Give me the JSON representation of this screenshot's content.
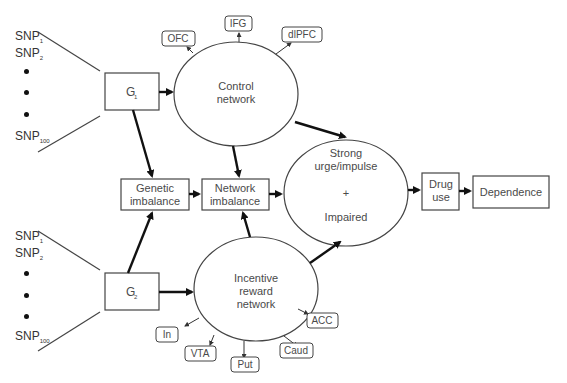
{
  "snp_groups": [
    {
      "items": [
        "SNP",
        "SNP",
        "SNP"
      ],
      "subs": [
        "1",
        "2",
        "100"
      ]
    },
    {
      "items": [
        "SNP",
        "SNP",
        "SNP"
      ],
      "subs": [
        "1",
        "2",
        "100"
      ]
    }
  ],
  "nodes": {
    "g1": {
      "label": "G",
      "sub": "1"
    },
    "g2": {
      "label": "G",
      "sub": "2"
    },
    "genetic_imbalance": {
      "line1": "Genetic",
      "line2": "imbalance"
    },
    "network_imbalance": {
      "line1": "Network",
      "line2": "imbalance"
    },
    "control_network": {
      "line1": "Control",
      "line2": "network"
    },
    "incentive_network": {
      "line1": "Incentive",
      "line2": "reward",
      "line3": "network"
    },
    "urge": {
      "line1": "Strong",
      "line2": "urge/impulse",
      "plus": "+",
      "line3": "Impaired"
    },
    "drug_use": {
      "line1": "Drug",
      "line2": "use"
    },
    "dependence": {
      "label": "Dependence"
    }
  },
  "control_regions": [
    "OFC",
    "IFG",
    "dlPFC"
  ],
  "reward_regions": [
    "In",
    "VTA",
    "Put",
    "Caud",
    "ACC"
  ],
  "colors": {
    "stroke": "#444444",
    "arrow": "#111111",
    "text": "#4a4a4a"
  }
}
